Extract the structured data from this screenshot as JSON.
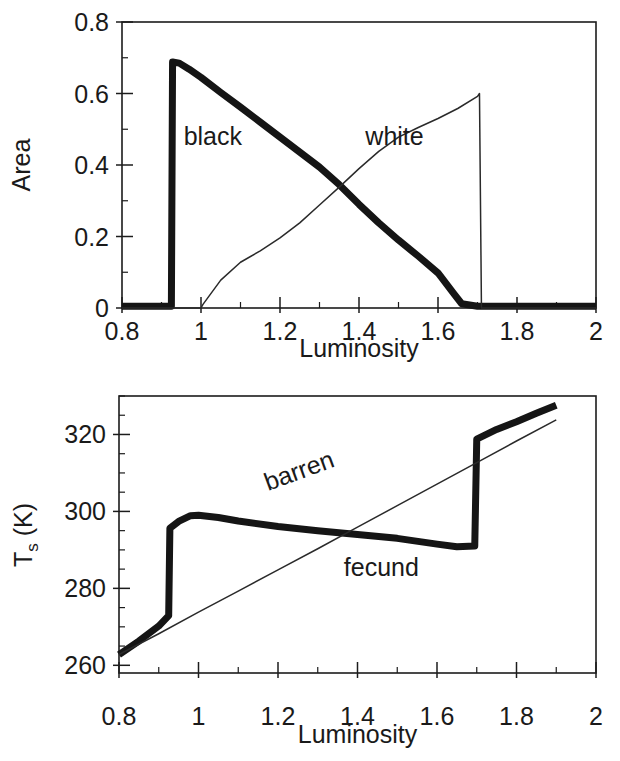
{
  "figure": {
    "name": "daisyworld-figure",
    "panels": [
      "area-panel",
      "temperature-panel"
    ]
  },
  "chart_data": [
    {
      "id": "area-panel",
      "type": "line",
      "title": "",
      "xlabel": "Luminosity",
      "ylabel": "Area",
      "xlim": [
        0.8,
        2.0
      ],
      "ylim": [
        0.0,
        0.8
      ],
      "xticks": [
        0.8,
        1.0,
        1.2,
        1.4,
        1.6,
        1.8,
        2.0
      ],
      "xticklabels": [
        "0.8",
        "1",
        "1.2",
        "1.4",
        "1.6",
        "1.8",
        "2"
      ],
      "yticks": [
        0.0,
        0.2,
        0.4,
        0.6,
        0.8
      ],
      "yticklabels": [
        "0",
        "0.2",
        "0.4",
        "0.6",
        "0.8"
      ],
      "xminor_step": 0.1,
      "yminor_step": 0.1,
      "grid": false,
      "legend": "inline-annotations",
      "series": [
        {
          "name": "black",
          "label": "black",
          "style": "thick",
          "annotation_x": 1.03,
          "annotation_y": 0.455,
          "x": [
            0.8,
            0.86,
            0.9,
            0.925,
            0.928,
            0.945,
            0.97,
            1.0,
            1.05,
            1.1,
            1.15,
            1.2,
            1.25,
            1.3,
            1.35,
            1.4,
            1.45,
            1.5,
            1.55,
            1.6,
            1.64,
            1.66,
            1.7,
            1.75,
            1.8,
            1.85,
            1.9,
            1.95,
            2.0
          ],
          "y": [
            0.005,
            0.005,
            0.005,
            0.005,
            0.688,
            0.685,
            0.668,
            0.645,
            0.603,
            0.562,
            0.52,
            0.478,
            0.436,
            0.394,
            0.345,
            0.29,
            0.238,
            0.19,
            0.145,
            0.098,
            0.04,
            0.012,
            0.005,
            0.005,
            0.005,
            0.005,
            0.005,
            0.005,
            0.005
          ]
        },
        {
          "name": "white",
          "label": "white",
          "style": "thin",
          "annotation_x": 1.49,
          "annotation_y": 0.455,
          "x": [
            0.8,
            0.9,
            0.97,
            1.0,
            1.005,
            1.05,
            1.1,
            1.15,
            1.2,
            1.25,
            1.3,
            1.35,
            1.4,
            1.45,
            1.5,
            1.55,
            1.6,
            1.65,
            1.7,
            1.705,
            1.71,
            1.8,
            1.9,
            2.0
          ],
          "y": [
            0.0,
            0.0,
            0.0,
            0.0,
            0.01,
            0.078,
            0.128,
            0.16,
            0.196,
            0.238,
            0.288,
            0.338,
            0.39,
            0.438,
            0.478,
            0.505,
            0.53,
            0.558,
            0.592,
            0.6,
            0.0,
            0.0,
            0.0,
            0.0
          ]
        }
      ]
    },
    {
      "id": "temperature-panel",
      "type": "line",
      "title": "",
      "xlabel": "Luminosity",
      "ylabel": "T_s (K)",
      "ylabel_main": "T",
      "ylabel_sub": "s",
      "ylabel_unit": " (K)",
      "xlim": [
        0.8,
        2.0
      ],
      "ylim": [
        258.0,
        330.0
      ],
      "xticks": [
        0.8,
        1.0,
        1.2,
        1.4,
        1.6,
        1.8,
        2.0
      ],
      "xticklabels": [
        "0.8",
        "1",
        "1.2",
        "1.4",
        "1.6",
        "1.8",
        "2"
      ],
      "yticks": [
        260,
        280,
        300,
        320
      ],
      "yticklabels": [
        "260",
        "280",
        "300",
        "320"
      ],
      "xminor_step": 0.1,
      "yminor_step": 5,
      "grid": false,
      "legend": "inline-annotations",
      "series": [
        {
          "name": "fecund",
          "label": "fecund",
          "style": "thick",
          "annotation_x": 1.46,
          "annotation_y": 283.2,
          "annotation_rotation": 0,
          "x": [
            0.8,
            0.85,
            0.9,
            0.925,
            0.928,
            0.95,
            0.98,
            1.0,
            1.05,
            1.1,
            1.2,
            1.3,
            1.4,
            1.5,
            1.6,
            1.65,
            1.695,
            1.7,
            1.75,
            1.8,
            1.85,
            1.9
          ],
          "y": [
            262.8,
            266.3,
            270.2,
            272.9,
            295.6,
            297.4,
            298.9,
            299.0,
            298.4,
            297.5,
            296.1,
            295.0,
            294.0,
            293.0,
            291.5,
            290.8,
            291.0,
            318.8,
            321.3,
            323.3,
            325.5,
            327.6
          ]
        },
        {
          "name": "barren",
          "label": "barren",
          "style": "thin",
          "annotation_x": 1.26,
          "annotation_y": 308.5,
          "annotation_rotation": -20,
          "x": [
            0.8,
            0.9,
            1.0,
            1.1,
            1.2,
            1.3,
            1.4,
            1.5,
            1.6,
            1.7,
            1.8,
            1.9
          ],
          "y": [
            262.8,
            268.2,
            273.8,
            279.3,
            284.8,
            290.3,
            295.9,
            301.5,
            307.1,
            312.7,
            318.3,
            323.8
          ]
        }
      ]
    }
  ],
  "colors": {
    "ink": "#1a1a1a",
    "thick_curve": "#151515",
    "thin_curve": "#2a2a2a",
    "background": "#ffffff"
  }
}
